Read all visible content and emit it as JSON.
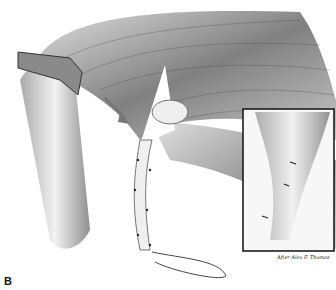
{
  "figure": {
    "panel_label": "B",
    "signature": "After Alex F. Thomas",
    "inset": {
      "present": true,
      "border_color": "#111111"
    }
  }
}
